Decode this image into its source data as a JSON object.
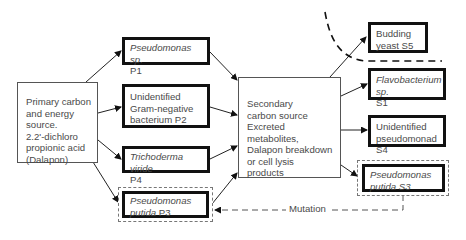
{
  "diagram": {
    "primary": {
      "lines": [
        "Primary carbon",
        "and energy",
        "source.",
        "2.2'-dichloro",
        "propionic acid",
        "(Dalapon)"
      ]
    },
    "primary_organisms": [
      {
        "id": "P1",
        "name": "Pseudomonas sp.",
        "name_italic": true,
        "code": "P1"
      },
      {
        "id": "P2",
        "name": "Unidentified Gram-negative bacterium",
        "line1": "Unidentified",
        "line2": "Gram-negative",
        "line3": "bacterium  P2",
        "name_italic": false,
        "code": "P2"
      },
      {
        "id": "P4",
        "name": "Trichoderma viride",
        "name_italic": true,
        "code": "P4"
      },
      {
        "id": "P3",
        "name": "Pseudomonas putida",
        "line1": "Pseudomonas",
        "line2": "putida",
        "name_italic": true,
        "code": "P3",
        "dashed_outline": true
      }
    ],
    "secondary": {
      "lines": [
        "Secondary",
        "carbon source",
        "Excreted",
        "metabolites,",
        "Dalapon breakdown",
        "or cell lysis",
        "products"
      ]
    },
    "secondary_organisms": [
      {
        "id": "S5",
        "line1": "Budding",
        "line2": "yeast  S5",
        "name_italic": false,
        "code": "S5"
      },
      {
        "id": "S1",
        "name": "Flavobacterium sp.",
        "name_italic": true,
        "code": "S1"
      },
      {
        "id": "S4",
        "line1": "Unidentified",
        "line2": "pseudomonad  S4",
        "name_italic": false,
        "code": "S4"
      },
      {
        "id": "S3",
        "line1": "Pseudomonas",
        "line2": "putida  S3",
        "name_italic": true,
        "code": "S3",
        "dashed_outline": true
      }
    ],
    "mutation_label": "Mutation",
    "colors": {
      "thick_border": "#111111",
      "thin_border": "#555555",
      "text": "#4a4a4a",
      "dash": "#777777"
    }
  }
}
